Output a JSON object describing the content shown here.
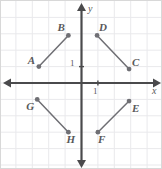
{
  "figure": {
    "kind": "coordinate-plane-scatter-segments",
    "width": 162,
    "height": 169,
    "background_color": "#ffffff",
    "border_color": "#d8d8d8",
    "grid_color": "#e9e9ec",
    "axis_color": "#4a4a4c",
    "mark_color": "#6f6f74",
    "label_color": "#58585a"
  },
  "axes": {
    "x_label": "x",
    "y_label": "y",
    "x_tick_label": "1",
    "y_tick_label": "1",
    "origin_px": {
      "x": 80.5,
      "y": 82
    },
    "unit_px": 16.4,
    "x_range": [
      -4.9,
      4.9
    ],
    "y_range": [
      -5.3,
      5.0
    ],
    "grid": true
  },
  "chart_data": {
    "type": "scatter",
    "title": "",
    "xlabel": "x",
    "ylabel": "y",
    "xlim": [
      -4.9,
      4.9
    ],
    "ylim": [
      -5.3,
      5.0
    ],
    "grid": true,
    "points": [
      {
        "name": "A",
        "x": -2.6,
        "y": 1.0,
        "label_dx": -11,
        "label_dy": -12
      },
      {
        "name": "B",
        "x": -0.8,
        "y": 2.9,
        "label_dx": -11,
        "label_dy": -13
      },
      {
        "name": "C",
        "x": 2.9,
        "y": 0.85,
        "label_dx": 3,
        "label_dy": -12
      },
      {
        "name": "D",
        "x": 0.95,
        "y": 2.9,
        "label_dx": 2,
        "label_dy": -13
      },
      {
        "name": "E",
        "x": 2.9,
        "y": -1.1,
        "label_dx": 3,
        "label_dy": 2
      },
      {
        "name": "F",
        "x": 1.0,
        "y": -3.0,
        "label_dx": 0,
        "label_dy": 2
      },
      {
        "name": "G",
        "x": -2.7,
        "y": -1.0,
        "label_dx": -11,
        "label_dy": 2
      },
      {
        "name": "H",
        "x": -0.8,
        "y": -3.0,
        "label_dx": -2,
        "label_dy": 2
      }
    ],
    "segments": [
      {
        "name": "AB",
        "from": "A",
        "to": "B"
      },
      {
        "name": "DC",
        "from": "D",
        "to": "C"
      },
      {
        "name": "GH",
        "from": "G",
        "to": "H"
      },
      {
        "name": "FE",
        "from": "F",
        "to": "E"
      }
    ]
  }
}
